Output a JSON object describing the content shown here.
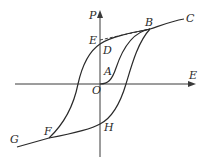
{
  "diagram": {
    "type": "ferroelectric hysteresis loop",
    "axes": {
      "x_label": "E",
      "y_label": "P",
      "origin_label": "O"
    },
    "points": [
      {
        "id": "A",
        "label": "A"
      },
      {
        "id": "B",
        "label": "B"
      },
      {
        "id": "C",
        "label": "C"
      },
      {
        "id": "D",
        "label": "D"
      },
      {
        "id": "E",
        "label": "E"
      },
      {
        "id": "F",
        "label": "F"
      },
      {
        "id": "G",
        "label": "G"
      },
      {
        "id": "H",
        "label": "H"
      }
    ],
    "colors": {
      "stroke": "#2a2a2a",
      "background": "#ffffff"
    }
  }
}
